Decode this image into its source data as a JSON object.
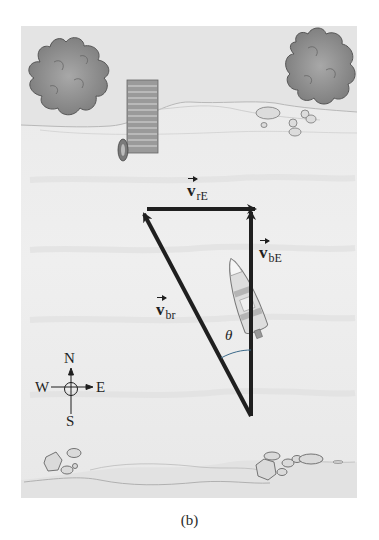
{
  "figure": {
    "caption": "(b)",
    "scene": "River crossing: boat heading north across a river flowing east",
    "colors": {
      "water": "#ececec",
      "bank": "#e3e3e3",
      "tree": "#8c8c8c",
      "tree_outline": "#555555",
      "arrow": "#1f1f1f",
      "dock": "#8a8a8a"
    }
  },
  "vectors": {
    "v_rE": {
      "symbol": "v",
      "subscript": "rE",
      "description": "velocity of river relative to Earth",
      "direction": "east"
    },
    "v_bE": {
      "symbol": "v",
      "subscript": "bE",
      "description": "velocity of boat relative to Earth",
      "direction": "north"
    },
    "v_br": {
      "symbol": "v",
      "subscript": "br",
      "description": "velocity of boat relative to river",
      "direction": "north-west"
    }
  },
  "angle": {
    "label": "θ"
  },
  "compass": {
    "north": "N",
    "south": "S",
    "east": "E",
    "west": "W"
  }
}
